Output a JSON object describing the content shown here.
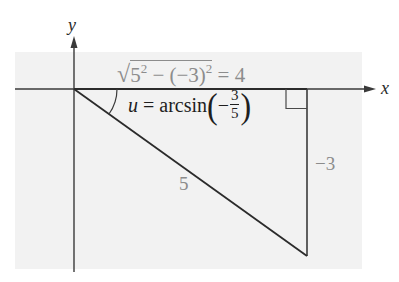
{
  "diagram": {
    "type": "right-triangle-reference",
    "axes": {
      "x_label": "x",
      "y_label": "y"
    },
    "triangle": {
      "hypotenuse_label": "5",
      "opposite_label": "−3",
      "adjacent_formula": {
        "radical_prefix": "√",
        "term1_base": "5",
        "term1_exp": "2",
        "minus": " − ",
        "term2_base": "(−3)",
        "term2_exp": "2",
        "result": " = 4"
      },
      "angle_formula": {
        "lhs": "u",
        "eq": " = arcsin",
        "open_paren": "(",
        "sign": "−",
        "numerator": "3",
        "denominator": "5",
        "close_paren": ")"
      }
    },
    "colors": {
      "background_panel": "#f2f2f2",
      "line": "#2b2b2b",
      "label_gray": "#8c8c8c",
      "label_dark": "#1e1e1e"
    }
  }
}
